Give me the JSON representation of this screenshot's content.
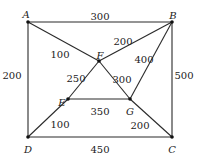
{
  "diagram": {
    "type": "weighted-graph",
    "nodes": [
      {
        "id": "A",
        "label": "A",
        "x": 28,
        "y": 22,
        "lx": 26,
        "ly": 15
      },
      {
        "id": "B",
        "label": "B",
        "x": 172,
        "y": 22,
        "lx": 173,
        "ly": 16
      },
      {
        "id": "C",
        "label": "C",
        "x": 172,
        "y": 137,
        "lx": 172,
        "ly": 150
      },
      {
        "id": "D",
        "label": "D",
        "x": 28,
        "y": 137,
        "lx": 28,
        "ly": 150
      },
      {
        "id": "E",
        "label": "E",
        "x": 68,
        "y": 99,
        "lx": 62,
        "ly": 103
      },
      {
        "id": "F",
        "label": "F",
        "x": 99,
        "y": 61,
        "lx": 100,
        "ly": 56
      },
      {
        "id": "G",
        "label": "G",
        "x": 130,
        "y": 99,
        "lx": 130,
        "ly": 112
      }
    ],
    "edges": [
      {
        "from": "A",
        "to": "B",
        "weight": "300",
        "lx": 100,
        "ly": 17
      },
      {
        "from": "A",
        "to": "D",
        "weight": "200",
        "lx": 12,
        "ly": 76
      },
      {
        "from": "B",
        "to": "C",
        "weight": "500",
        "lx": 184,
        "ly": 76
      },
      {
        "from": "D",
        "to": "C",
        "weight": "450",
        "lx": 100,
        "ly": 150
      },
      {
        "from": "A",
        "to": "F",
        "weight": "100",
        "lx": 60,
        "ly": 55
      },
      {
        "from": "F",
        "to": "B",
        "weight": "200",
        "lx": 123,
        "ly": 42
      },
      {
        "from": "B",
        "to": "G",
        "weight": "400",
        "lx": 144,
        "ly": 60
      },
      {
        "from": "F",
        "to": "E",
        "weight": "250",
        "lx": 76,
        "ly": 79
      },
      {
        "from": "F",
        "to": "G",
        "weight": "300",
        "lx": 122,
        "ly": 80
      },
      {
        "from": "E",
        "to": "G",
        "weight": "350",
        "lx": 100,
        "ly": 112
      },
      {
        "from": "D",
        "to": "E",
        "weight": "100",
        "lx": 60,
        "ly": 125
      },
      {
        "from": "G",
        "to": "C",
        "weight": "200",
        "lx": 140,
        "ly": 126
      }
    ]
  }
}
